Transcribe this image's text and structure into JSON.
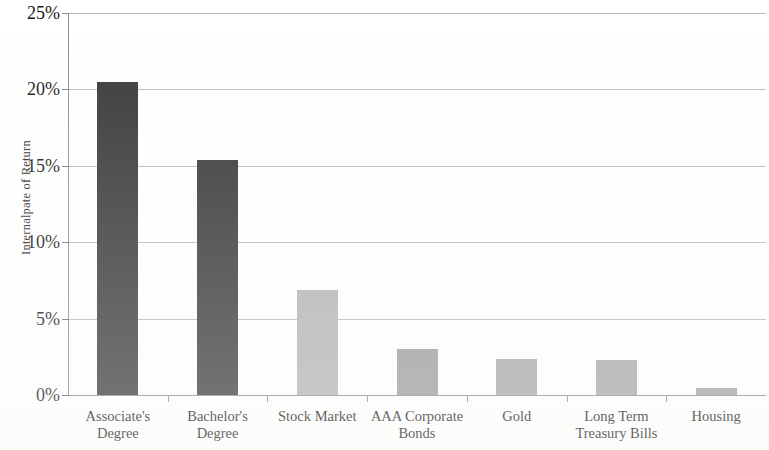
{
  "chart_data": {
    "type": "bar",
    "title": "",
    "subtitle": "",
    "xlabel": "",
    "ylabel": "Internalpate of Return",
    "categories": [
      "Associate's Degree",
      "Bachelor's Degree",
      "Stock Market",
      "AAA Corporate Bonds",
      "Gold",
      "Long Term Treasury Bills",
      "Housing"
    ],
    "category_lines": [
      [
        "Associate's",
        "Degree"
      ],
      [
        "Bachelor's",
        "Degree"
      ],
      [
        "Stock Market",
        ""
      ],
      [
        "AAA Corporate",
        "Bonds"
      ],
      [
        "Gold",
        ""
      ],
      [
        "Long Term",
        "Treasury Bills"
      ],
      [
        "Housing",
        ""
      ]
    ],
    "values": [
      20.5,
      15.4,
      6.9,
      3.0,
      2.35,
      2.3,
      0.45
    ],
    "value_labels": [
      "20.5%",
      "15.4%",
      "6.9%",
      "3.0%",
      "2.4%",
      "2.3%",
      "0.5%"
    ],
    "bar_colors": [
      "#383838",
      "#383838",
      "#b3b3b3",
      "#9b9b9b",
      "#a6a6a6",
      "#a6a6a6",
      "#a0a0a0"
    ],
    "ylim": [
      0,
      25
    ],
    "ytick_values": [
      25,
      20,
      15,
      10,
      5,
      0
    ],
    "ytick_labels": [
      "25%",
      "20%",
      "15%",
      "10%",
      "5%",
      "0%"
    ],
    "grid": true,
    "grid_axis": "y",
    "legend": null,
    "legend_position": "none",
    "annotations": []
  },
  "axes": {
    "y_title": "Internalpate of Return",
    "y_tick_labels": [
      "25%",
      "20%",
      "15%",
      "10%",
      "5%",
      "0%"
    ]
  }
}
